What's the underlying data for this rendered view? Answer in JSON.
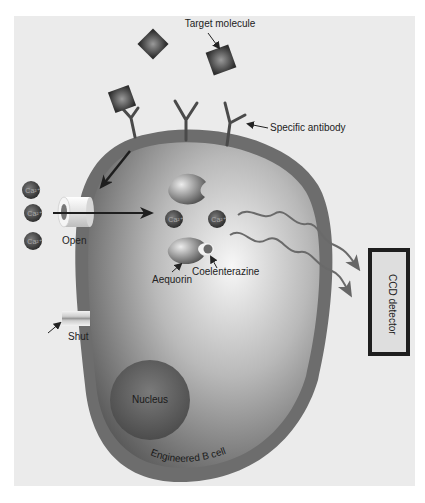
{
  "figure": {
    "background": "#ebebeb",
    "labels": {
      "target_molecule": "Target molecule",
      "specific_antibody": "Specific antibody",
      "open": "Open",
      "shut": "Shut",
      "aequorin": "Aequorin",
      "coelenterazine": "Coelenterazine",
      "ccd_detector": "CCD detector",
      "nucleus": "Nucleus",
      "cell": "Engineered B cell",
      "calcium_ion": "Ca²⁺"
    },
    "colors": {
      "cell_membrane": "#6e6e6e",
      "cell_interior_light": "#f4f4f4",
      "cell_interior_dark": "#5a5a5a",
      "molecule": "#3a3a3a",
      "arrow": "#222222",
      "wave": "#6a6a6a",
      "detector_border": "#1e1e1e",
      "detector_fill": "#dedede"
    }
  }
}
